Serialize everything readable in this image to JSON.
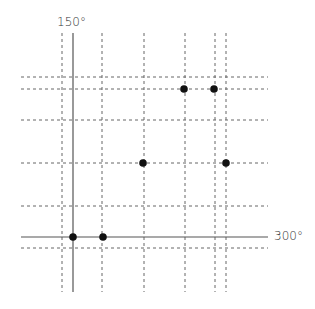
{
  "diagram": {
    "type": "grid-plot",
    "axis_labels": {
      "vertical": "150°",
      "horizontal": "300°"
    },
    "solid_axes": {
      "vertical_x": 73,
      "horizontal_y": 237
    },
    "dashed_vertical_x": [
      62,
      102,
      144,
      185,
      215,
      226
    ],
    "dashed_horizontal_y": [
      77,
      89,
      120,
      163,
      206,
      248
    ],
    "points": [
      {
        "x": 73,
        "y": 237
      },
      {
        "x": 103,
        "y": 237
      },
      {
        "x": 143,
        "y": 163
      },
      {
        "x": 226,
        "y": 163
      },
      {
        "x": 184,
        "y": 89
      },
      {
        "x": 214,
        "y": 89
      }
    ],
    "colors": {
      "line": "#555555",
      "dash": "#666666",
      "point": "#111111"
    }
  }
}
